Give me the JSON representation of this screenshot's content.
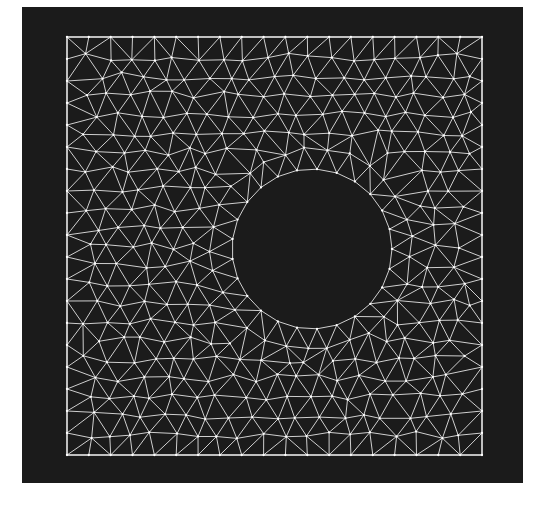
{
  "figure": {
    "colors": {
      "page_background": "#ffffff",
      "plot_background": "#1b1b1b",
      "mesh_line": "#cfcfcf",
      "mesh_node": "#ffffff",
      "domain_border": "#e8e8e8"
    },
    "plot_area": {
      "x": 22,
      "y": 7,
      "width": 501,
      "height": 476
    },
    "mesh": {
      "type": "triangular-mesh",
      "square": {
        "x0": 67,
        "y0": 37,
        "x1": 482,
        "y1": 455
      },
      "hole": {
        "cx": 312,
        "cy": 249,
        "r": 80
      },
      "edge_length": 22,
      "hole_segments": 25,
      "ring_offset_factor": 0.92,
      "lattice_exclusion_factor": 1.5,
      "seed": 7,
      "line_width": 1,
      "border_width": 1.3,
      "node_radius": 1.15
    }
  }
}
